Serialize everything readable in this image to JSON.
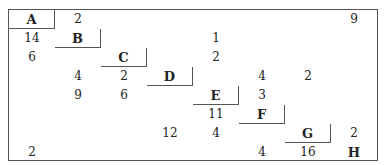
{
  "matrix": {
    "labels": [
      "A",
      "B",
      "C",
      "D",
      "E",
      "F",
      "G",
      "H"
    ],
    "cells": [
      {
        "row": 0,
        "col": 1,
        "value": "2"
      },
      {
        "row": 0,
        "col": 7,
        "value": "9"
      },
      {
        "row": 1,
        "col": 0,
        "value": "14"
      },
      {
        "row": 1,
        "col": 4,
        "value": "1"
      },
      {
        "row": 2,
        "col": 0,
        "value": "6"
      },
      {
        "row": 2,
        "col": 4,
        "value": "2"
      },
      {
        "row": 3,
        "col": 1,
        "value": "4"
      },
      {
        "row": 3,
        "col": 2,
        "value": "2"
      },
      {
        "row": 3,
        "col": 5,
        "value": "4"
      },
      {
        "row": 3,
        "col": 6,
        "value": "2"
      },
      {
        "row": 4,
        "col": 1,
        "value": "9"
      },
      {
        "row": 4,
        "col": 2,
        "value": "6"
      },
      {
        "row": 4,
        "col": 5,
        "value": "3"
      },
      {
        "row": 5,
        "col": 4,
        "value": "11"
      },
      {
        "row": 6,
        "col": 3,
        "value": "12"
      },
      {
        "row": 6,
        "col": 4,
        "value": "4"
      },
      {
        "row": 6,
        "col": 7,
        "value": "2"
      },
      {
        "row": 7,
        "col": 0,
        "value": "2"
      },
      {
        "row": 7,
        "col": 5,
        "value": "4"
      },
      {
        "row": 7,
        "col": 6,
        "value": "16"
      }
    ]
  }
}
